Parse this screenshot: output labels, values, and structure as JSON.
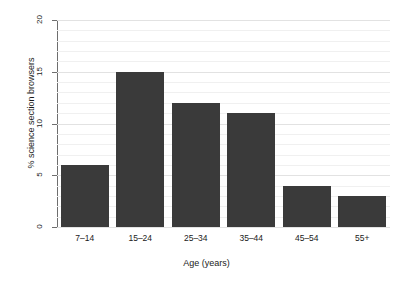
{
  "chart_data": {
    "type": "bar",
    "title": "",
    "xlabel": "Age (years)",
    "ylabel": "% science section browsers",
    "categories": [
      "7–14",
      "15–24",
      "25–34",
      "35–44",
      "45–54",
      "55+"
    ],
    "values": [
      6,
      15,
      12,
      11,
      4,
      3
    ],
    "ylim": [
      0,
      20
    ],
    "ytick_labels": [
      "0",
      "5",
      "10",
      "15",
      "20"
    ],
    "ytick_values": [
      0,
      5,
      10,
      15,
      20
    ],
    "minor_gridline_step": 1,
    "grid": true,
    "legend": "none",
    "bar_color": "#3a3a3a",
    "background_color": "#ffffff",
    "axis_color": "#6e6e6e",
    "gridline_color": "#f0f0f0",
    "major_gridline_color": "#e2e2e2"
  }
}
